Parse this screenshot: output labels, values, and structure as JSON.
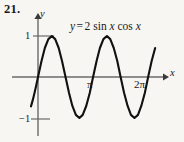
{
  "exercise": {
    "number": "21."
  },
  "equation": {
    "lhs": "y",
    "equals": "=",
    "coefficient": "2",
    "sin": "sin",
    "var1": "x",
    "cos": "cos",
    "var2": "x",
    "full_text": "y = 2 sin x cos x"
  },
  "axes": {
    "y_label": "y",
    "x_label": "x",
    "y_ticks": [
      {
        "label": "1",
        "value": 1
      },
      {
        "label": "−1",
        "value": -1
      }
    ],
    "x_ticks": [
      {
        "label": "π",
        "value": 3.14159
      },
      {
        "label": "2π",
        "value": 6.28319
      }
    ]
  },
  "colors": {
    "background": "#f7f6f2",
    "curve": "#111111",
    "axis": "#6a6a6a",
    "text": "#1a1a1a"
  },
  "chart_data": {
    "type": "line",
    "title": "",
    "subtitle": "",
    "xlabel": "x",
    "ylabel": "y",
    "function": "y = 2 sin x cos x",
    "equivalent_function": "y = sin 2x",
    "amplitude": 1,
    "period": 3.14159,
    "xlim": [
      -0.45,
      7.1
    ],
    "ylim": [
      -1.45,
      1.45
    ],
    "grid": false,
    "legend": null,
    "x_tick_values": [
      3.14159,
      6.28319
    ],
    "x_tick_labels": [
      "π",
      "2π"
    ],
    "y_tick_values": [
      1,
      -1
    ],
    "y_tick_labels": [
      "1",
      "−1"
    ],
    "annotations": [
      {
        "text": "y = 2 sin x cos x",
        "x": 2.6,
        "y": 1.32
      }
    ],
    "series": [
      {
        "name": "y = 2 sin x cos x",
        "color": "#111111",
        "x": [
          -0.4,
          -0.3,
          -0.2,
          -0.1,
          0.0,
          0.2,
          0.39,
          0.59,
          0.79,
          0.98,
          1.18,
          1.37,
          1.57,
          1.77,
          1.96,
          2.16,
          2.36,
          2.55,
          2.75,
          2.95,
          3.14,
          3.34,
          3.53,
          3.73,
          3.93,
          4.12,
          4.32,
          4.52,
          4.71,
          4.91,
          5.11,
          5.3,
          5.5,
          5.7,
          5.89,
          6.09,
          6.28,
          6.48,
          6.68
        ],
        "y": [
          -0.717,
          -0.565,
          -0.389,
          -0.199,
          0.0,
          0.389,
          0.707,
          0.924,
          1.0,
          0.924,
          0.707,
          0.389,
          0.0,
          -0.389,
          -0.707,
          -0.924,
          -1.0,
          -0.924,
          -0.707,
          -0.389,
          0.0,
          0.389,
          0.707,
          0.924,
          1.0,
          0.924,
          0.707,
          0.389,
          0.0,
          -0.389,
          -0.707,
          -0.924,
          -1.0,
          -0.924,
          -0.707,
          -0.389,
          0.0,
          0.389,
          0.707
        ]
      }
    ]
  }
}
